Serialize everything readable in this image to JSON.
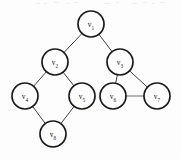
{
  "figure": {
    "background_color": "#fdfdfd",
    "node_fill": "#ffffff",
    "node_stroke": "#1a1a1a",
    "edge_color": "#2b2b2b",
    "faint_edge_color": "#9a9a9a",
    "width": 181,
    "height": 159
  },
  "graph": {
    "node_radius": 13,
    "nodes": [
      {
        "id": "v1",
        "label": "v",
        "sub": "1",
        "cx": 91,
        "cy": 24
      },
      {
        "id": "v2",
        "label": "v",
        "sub": "2",
        "cx": 55,
        "cy": 62
      },
      {
        "id": "v3",
        "label": "v",
        "sub": "3",
        "cx": 120,
        "cy": 62
      },
      {
        "id": "v4",
        "label": "v",
        "sub": "4",
        "cx": 25,
        "cy": 96
      },
      {
        "id": "v5",
        "label": "v",
        "sub": "5",
        "cx": 82,
        "cy": 96
      },
      {
        "id": "v6",
        "label": "v",
        "sub": "6",
        "cx": 113,
        "cy": 96
      },
      {
        "id": "v7",
        "label": "v",
        "sub": "7",
        "cx": 157,
        "cy": 96
      },
      {
        "id": "v8",
        "label": "v",
        "sub": "8",
        "cx": 53,
        "cy": 134
      }
    ],
    "edges": [
      {
        "from": "v1",
        "to": "v2",
        "style": "solid"
      },
      {
        "from": "v1",
        "to": "v3",
        "style": "solid"
      },
      {
        "from": "v2",
        "to": "v4",
        "style": "solid"
      },
      {
        "from": "v2",
        "to": "v5",
        "style": "solid"
      },
      {
        "from": "v4",
        "to": "v8",
        "style": "solid"
      },
      {
        "from": "v5",
        "to": "v8",
        "style": "solid"
      },
      {
        "from": "v3",
        "to": "v6",
        "style": "solid"
      },
      {
        "from": "v3",
        "to": "v7",
        "style": "solid"
      },
      {
        "from": "v6",
        "to": "v7",
        "style": "faint"
      }
    ]
  },
  "artifacts": {
    "specks": [
      {
        "x": 36,
        "y": 3,
        "w": 4
      },
      {
        "x": 44,
        "y": 3,
        "w": 3
      },
      {
        "x": 54,
        "y": 2,
        "w": 5
      },
      {
        "x": 66,
        "y": 3,
        "w": 3
      },
      {
        "x": 74,
        "y": 2,
        "w": 4
      },
      {
        "x": 104,
        "y": 3,
        "w": 6
      },
      {
        "x": 116,
        "y": 2,
        "w": 3
      },
      {
        "x": 132,
        "y": 3,
        "w": 5
      },
      {
        "x": 143,
        "y": 2,
        "w": 4
      },
      {
        "x": 152,
        "y": 3,
        "w": 3
      },
      {
        "x": 160,
        "y": 2,
        "w": 5
      }
    ]
  }
}
